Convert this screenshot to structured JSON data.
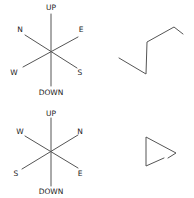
{
  "compasses": [
    {
      "name": "compass-top",
      "labels": {
        "up": "UP",
        "down": "DOWN",
        "upper_left": "N",
        "upper_right": "E",
        "lower_left": "W",
        "lower_right": "S"
      }
    },
    {
      "name": "compass-bottom",
      "labels": {
        "up": "UP",
        "down": "DOWN",
        "upper_left": "W",
        "upper_right": "N",
        "lower_left": "S",
        "lower_right": "E"
      }
    }
  ],
  "shapes": [
    {
      "name": "zigzag-path",
      "description": "folded polyline"
    },
    {
      "name": "triangle-path",
      "description": "right-pointing triangle outline"
    }
  ],
  "colors": {
    "line": "#555555",
    "text": "#222222",
    "background": "#ffffff"
  }
}
